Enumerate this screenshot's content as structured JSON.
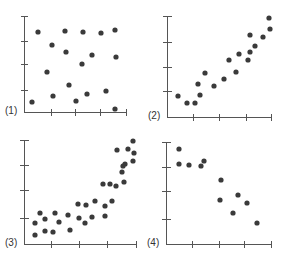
{
  "chart_data": [
    {
      "type": "scatter",
      "label": "(1)",
      "title": "",
      "xlabel": "",
      "ylabel": "",
      "grid": false,
      "legend": null,
      "xlim": [
        0,
        4
      ],
      "ylim": [
        0,
        4
      ],
      "description": "No correlation",
      "points": [
        [
          0.3,
          0.7
        ],
        [
          0.5,
          3.0
        ],
        [
          1.1,
          1.7
        ],
        [
          1.1,
          1.1
        ],
        [
          1.4,
          2.6
        ],
        [
          1.9,
          3.0
        ],
        [
          1.9,
          2.3
        ],
        [
          2.1,
          1.2
        ],
        [
          2.7,
          0.7
        ],
        [
          2.9,
          1.8
        ],
        [
          3.0,
          2.9
        ],
        [
          3.2,
          0.9
        ],
        [
          3.3,
          2.2
        ],
        [
          3.9,
          2.9
        ],
        [
          4.0,
          0.9
        ],
        [
          4.1,
          3.1
        ],
        [
          4.1,
          2.1
        ],
        [
          3.9,
          0.3
        ]
      ],
      "pixels": [
        [
          32,
          102
        ],
        [
          38,
          32
        ],
        [
          47,
          72
        ],
        [
          53,
          96
        ],
        [
          52,
          45
        ],
        [
          65,
          31
        ],
        [
          66,
          52
        ],
        [
          69,
          85
        ],
        [
          76,
          101
        ],
        [
          82,
          64
        ],
        [
          83,
          32
        ],
        [
          87,
          94
        ],
        [
          92,
          55
        ],
        [
          101,
          33
        ],
        [
          106,
          91
        ],
        [
          115,
          30
        ],
        [
          116,
          57
        ],
        [
          115,
          109
        ]
      ]
    },
    {
      "type": "scatter",
      "label": "(2)",
      "title": "",
      "xlabel": "",
      "ylabel": "",
      "grid": false,
      "legend": null,
      "xlim": [
        0,
        4
      ],
      "ylim": [
        0,
        4
      ],
      "description": "Positive linear correlation",
      "points": [
        [
          0.4,
          0.6
        ],
        [
          0.8,
          0.3
        ],
        [
          1.1,
          0.3
        ],
        [
          1.2,
          0.9
        ],
        [
          1.3,
          0.6
        ],
        [
          1.5,
          1.5
        ],
        [
          1.9,
          0.9
        ],
        [
          2.3,
          1.3
        ],
        [
          2.5,
          2.0
        ],
        [
          2.9,
          1.4
        ],
        [
          3.0,
          2.3
        ],
        [
          3.2,
          2.0
        ],
        [
          3.2,
          2.5
        ],
        [
          3.3,
          3.0
        ],
        [
          3.5,
          2.7
        ],
        [
          3.9,
          2.9
        ],
        [
          4.0,
          3.6
        ],
        [
          4.1,
          3.2
        ]
      ],
      "pixels": [
        [
          178,
          96
        ],
        [
          187,
          103
        ],
        [
          195,
          103
        ],
        [
          198,
          84
        ],
        [
          200,
          95
        ],
        [
          205,
          73
        ],
        [
          214,
          86
        ],
        [
          224,
          79
        ],
        [
          229,
          60
        ],
        [
          236,
          72
        ],
        [
          239,
          54
        ],
        [
          248,
          60
        ],
        [
          250,
          52
        ],
        [
          250,
          35
        ],
        [
          255,
          46
        ],
        [
          263,
          37
        ],
        [
          269,
          18
        ],
        [
          270,
          29
        ]
      ]
    },
    {
      "type": "scatter",
      "label": "(3)",
      "title": "",
      "xlabel": "",
      "ylabel": "",
      "grid": false,
      "legend": null,
      "xlim": [
        0,
        4
      ],
      "ylim": [
        0,
        4
      ],
      "description": "Positive non-linear (curved) correlation",
      "points": [
        [
          0.3,
          1.2
        ],
        [
          0.4,
          0.5
        ],
        [
          0.6,
          1.5
        ],
        [
          0.7,
          1.3
        ],
        [
          0.7,
          0.7
        ],
        [
          1.0,
          0.7
        ],
        [
          1.1,
          1.6
        ],
        [
          1.2,
          1.2
        ],
        [
          1.5,
          1.5
        ],
        [
          1.6,
          0.8
        ],
        [
          1.8,
          2.0
        ],
        [
          1.9,
          1.4
        ],
        [
          2.2,
          1.2
        ],
        [
          2.2,
          2.0
        ],
        [
          2.5,
          1.4
        ],
        [
          2.6,
          2.2
        ],
        [
          2.9,
          1.5
        ],
        [
          2.9,
          1.9
        ],
        [
          3.0,
          2.9
        ],
        [
          3.2,
          2.9
        ],
        [
          3.3,
          2.2
        ],
        [
          3.4,
          3.7
        ],
        [
          3.5,
          2.4
        ],
        [
          3.6,
          3.1
        ],
        [
          3.7,
          3.6
        ],
        [
          3.8,
          2.6
        ],
        [
          3.8,
          3.2
        ],
        [
          3.9,
          3.9
        ],
        [
          3.9,
          3.3
        ],
        [
          4.0,
          4.0
        ],
        [
          4.0,
          3.6
        ]
      ],
      "pixels": [
        [
          35,
          223
        ],
        [
          35,
          235
        ],
        [
          40,
          213
        ],
        [
          45,
          219
        ],
        [
          45,
          231
        ],
        [
          53,
          232
        ],
        [
          55,
          213
        ],
        [
          59,
          222
        ],
        [
          68,
          215
        ],
        [
          70,
          230
        ],
        [
          78,
          204
        ],
        [
          79,
          218
        ],
        [
          85,
          223
        ],
        [
          86,
          205
        ],
        [
          92,
          217
        ],
        [
          95,
          201
        ],
        [
          105,
          216
        ],
        [
          105,
          206
        ],
        [
          103,
          184
        ],
        [
          110,
          184
        ],
        [
          112,
          201
        ],
        [
          117,
          150
        ],
        [
          116,
          186
        ],
        [
          122,
          172
        ],
        [
          123,
          166
        ],
        [
          124,
          182
        ],
        [
          125,
          164
        ],
        [
          128,
          149
        ],
        [
          133,
          161
        ],
        [
          133,
          141
        ],
        [
          134,
          153
        ]
      ]
    },
    {
      "type": "scatter",
      "label": "(4)",
      "title": "",
      "xlabel": "",
      "ylabel": "",
      "grid": false,
      "legend": null,
      "xlim": [
        0,
        4
      ],
      "ylim": [
        0,
        4
      ],
      "description": "Negative linear correlation",
      "points": [
        [
          0.4,
          3.5
        ],
        [
          0.4,
          2.9
        ],
        [
          0.8,
          2.8
        ],
        [
          1.3,
          2.8
        ],
        [
          1.4,
          3.0
        ],
        [
          2.0,
          2.3
        ],
        [
          2.0,
          1.5
        ],
        [
          2.5,
          1.0
        ],
        [
          2.8,
          1.6
        ],
        [
          3.1,
          1.4
        ],
        [
          3.5,
          0.6
        ]
      ],
      "pixels": [
        [
          179,
          149
        ],
        [
          179,
          164
        ],
        [
          189,
          165
        ],
        [
          201,
          166
        ],
        [
          204,
          161
        ],
        [
          221,
          180
        ],
        [
          220,
          200
        ],
        [
          233,
          213
        ],
        [
          238,
          195
        ],
        [
          247,
          203
        ],
        [
          257,
          223
        ]
      ]
    }
  ],
  "panels": [
    {
      "label": "(1)"
    },
    {
      "label": "(2)"
    },
    {
      "label": "(3)"
    },
    {
      "label": "(4)"
    }
  ],
  "colors": {
    "dot": "#3a3a3a",
    "axis": "#555555"
  }
}
